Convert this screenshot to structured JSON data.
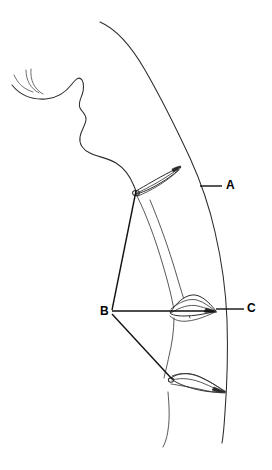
{
  "figure": {
    "width": 272,
    "height": 470,
    "background_color": "#ffffff",
    "ink_color": "#2b2b2b",
    "label_color": "#000000",
    "style": "black ink line art, no shading"
  },
  "labels": [
    {
      "id": "A",
      "text": "A",
      "x": 228,
      "y": 186,
      "leader": {
        "from_x": 200,
        "from_y": 186,
        "to_x": 222,
        "to_y": 186,
        "orientation": "horizontal"
      },
      "points_to": "upper-fin-outer-curve"
    },
    {
      "id": "B",
      "text": "B",
      "x": 105,
      "y": 312,
      "leader_count": 3,
      "points_to": "three-fin-bases"
    },
    {
      "id": "C",
      "text": "C",
      "x": 250,
      "y": 309,
      "leader": {
        "from_x": 216,
        "from_y": 309,
        "to_x": 244,
        "to_y": 309,
        "orientation": "horizontal"
      },
      "points_to": "middle-fin"
    }
  ],
  "callout_lines": {
    "b_to_upper_fin": {
      "x1": 112,
      "y1": 310,
      "x2": 136,
      "y2": 191
    },
    "b_to_middle_fin": {
      "x1": 112,
      "y1": 311,
      "x2": 214,
      "y2": 311
    },
    "b_to_lower_fin": {
      "x1": 112,
      "y1": 314,
      "x2": 172,
      "y2": 378
    }
  },
  "shapes": {
    "profile_outline": "face profile: forehead, nose, lips, chin descending from upper-left to centre",
    "hair_strands": "two fine crossed strands at upper left",
    "outer_body_curve": "long curve from top centre down the right side to the bottom",
    "inner_body_curve": "parallel inner curve with scalloped notches at each fin",
    "fins": [
      {
        "name": "upper-fin",
        "label": "A",
        "tip_x": 180,
        "tip_y": 168,
        "base_x": 136,
        "base_y": 191
      },
      {
        "name": "middle-fin",
        "label": "C",
        "tip_x": 215,
        "tip_y": 312,
        "base_x": 170,
        "base_y": 313
      },
      {
        "name": "lower-fin",
        "label": "B",
        "tip_x": 224,
        "tip_y": 390,
        "base_x": 172,
        "base_y": 378
      }
    ]
  }
}
